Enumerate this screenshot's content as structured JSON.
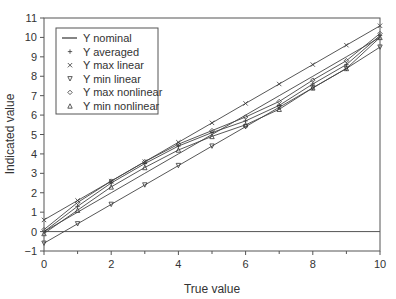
{
  "chart_data": {
    "type": "line",
    "title": "",
    "xlabel": "True value",
    "ylabel": "Indicated value",
    "xlim": [
      0,
      10
    ],
    "ylim": [
      -1,
      11
    ],
    "xticks": [
      0,
      2,
      4,
      6,
      8,
      10
    ],
    "xticks_minor": [
      1,
      3,
      5,
      7,
      9
    ],
    "yticks": [
      -1,
      0,
      1,
      2,
      3,
      4,
      5,
      6,
      7,
      8,
      9,
      10,
      11
    ],
    "grid": false,
    "legend_position": "upper left",
    "x": [
      0,
      1,
      2,
      3,
      4,
      5,
      6,
      7,
      8,
      9,
      10
    ],
    "series": [
      {
        "name": "Y nominal",
        "marker": "none",
        "values": [
          0,
          1,
          2,
          3,
          4,
          5,
          6,
          7,
          8,
          9,
          10
        ]
      },
      {
        "name": "Y averaged",
        "marker": "plus",
        "values": [
          0.0,
          1.3,
          2.5,
          3.5,
          4.4,
          5.1,
          5.7,
          6.5,
          7.6,
          8.6,
          10.1
        ]
      },
      {
        "name": "Y max linear",
        "marker": "x",
        "values": [
          0.6,
          1.6,
          2.6,
          3.6,
          4.6,
          5.6,
          6.6,
          7.6,
          8.6,
          9.6,
          10.6
        ]
      },
      {
        "name": "Y min linear",
        "marker": "triangle-down",
        "values": [
          -0.6,
          0.4,
          1.4,
          2.4,
          3.4,
          4.4,
          5.4,
          6.4,
          7.4,
          8.4,
          9.5
        ]
      },
      {
        "name": "Y max nonlinear",
        "marker": "diamond",
        "values": [
          0.1,
          1.5,
          2.6,
          3.6,
          4.5,
          5.2,
          5.9,
          6.7,
          7.8,
          8.8,
          10.2
        ]
      },
      {
        "name": "Y min nonlinear",
        "marker": "triangle-up",
        "values": [
          -0.1,
          1.1,
          2.3,
          3.3,
          4.2,
          4.9,
          5.5,
          6.3,
          7.4,
          8.4,
          10.0
        ]
      }
    ],
    "zero_line": 0
  },
  "legend": {
    "items": [
      "Y nominal",
      "Y averaged",
      "Y max linear",
      "Y min linear",
      "Y max nonlinear",
      "Y min nonlinear"
    ]
  },
  "axes": {
    "xlabel": "True value",
    "ylabel": "Indicated value"
  }
}
